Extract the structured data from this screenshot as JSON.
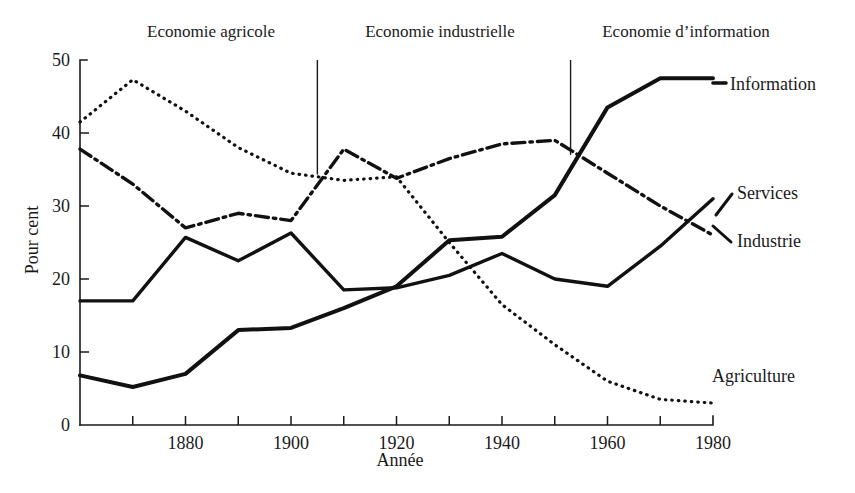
{
  "chart_data": {
    "type": "line",
    "title": "",
    "xlabel": "Année",
    "ylabel": "Pour cent",
    "xlim": [
      1860,
      1980
    ],
    "ylim": [
      0,
      50
    ],
    "grid": false,
    "legend_position": "right-inline-labels",
    "x": [
      1860,
      1870,
      1880,
      1890,
      1900,
      1910,
      1920,
      1930,
      1940,
      1950,
      1960,
      1970,
      1980
    ],
    "xticks_major": [
      1880,
      1900,
      1920,
      1940,
      1960,
      1980
    ],
    "xticks_minor": [
      1870,
      1890,
      1910,
      1930,
      1950,
      1970
    ],
    "yticks": [
      0,
      10,
      20,
      30,
      40,
      50
    ],
    "series": [
      {
        "name": "Information",
        "style": "solid-thick",
        "values": [
          6.8,
          5.2,
          7.0,
          13.0,
          13.3,
          16.0,
          19.0,
          25.3,
          25.8,
          31.5,
          43.5,
          47.5,
          47.5
        ]
      },
      {
        "name": "Services",
        "style": "solid",
        "values": [
          17.0,
          17.0,
          25.7,
          22.5,
          26.3,
          18.5,
          18.8,
          20.5,
          23.5,
          20.0,
          19.0,
          24.5,
          31.0
        ]
      },
      {
        "name": "Industrie",
        "style": "dash-dot",
        "values": [
          37.8,
          33.0,
          27.0,
          29.0,
          28.0,
          37.8,
          33.8,
          36.5,
          38.5,
          39.0,
          34.5,
          30.0,
          26.0
        ]
      },
      {
        "name": "Agriculture",
        "style": "dotted",
        "values": [
          41.5,
          47.3,
          43.0,
          38.0,
          34.5,
          33.5,
          34.0,
          25.0,
          16.5,
          11.0,
          6.0,
          3.5,
          3.0
        ]
      }
    ],
    "era_annotations": [
      {
        "label": "Economie agricole",
        "x_center": 1903,
        "divider_year": null
      },
      {
        "label": "Economie industrielle",
        "x_center": 1947,
        "divider_year": 1905
      },
      {
        "label": "Economie d’information",
        "x_center": 1990,
        "divider_year": 1953
      }
    ],
    "dividers": [
      {
        "year": 1905,
        "y_top": 50,
        "y_bottom": 34.3
      },
      {
        "year": 1953,
        "y_top": 50,
        "y_bottom": 37.0
      }
    ],
    "series_labels": [
      {
        "name": "Information",
        "value_label": "Information"
      },
      {
        "name": "Services",
        "value_label": "Services"
      },
      {
        "name": "Industrie",
        "value_label": "Industrie"
      },
      {
        "name": "Agriculture",
        "value_label": "Agriculture"
      }
    ]
  },
  "axis": {
    "y_title": "Pour cent",
    "x_title": "Année",
    "y_tick_labels": [
      "0",
      "10",
      "20",
      "30",
      "40",
      "50"
    ],
    "x_tick_labels": [
      "1880",
      "1900",
      "1920",
      "1940",
      "1960",
      "1980"
    ]
  },
  "annotations": {
    "era1": "Economie agricole",
    "era2": "Economie industrielle",
    "era3": "Economie d’information"
  },
  "labels": {
    "information": "Information",
    "services": "Services",
    "industrie": "Industrie",
    "agriculture": "Agriculture"
  },
  "colors": {
    "ink": "#1a1a1a",
    "line": "#111111",
    "background": "#ffffff"
  }
}
